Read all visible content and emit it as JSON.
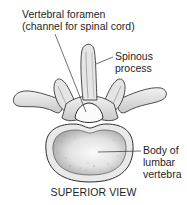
{
  "diagram": {
    "title": "SUPERIOR VIEW",
    "subject": "Lumbar vertebra",
    "labels": [
      {
        "id": "foramen",
        "lines": [
          "Vertebral foramen",
          "(channel for spinal cord)"
        ]
      },
      {
        "id": "spinous",
        "lines": [
          "Spinous",
          "process"
        ]
      },
      {
        "id": "body",
        "lines": [
          "Body of",
          "lumbar",
          "vertebra"
        ]
      }
    ]
  },
  "colors": {
    "bone_fill": "#eeeeee",
    "bone_outline": "#3a3a3a",
    "body_center": "#f4f4f4",
    "shading": "#9a9a9a",
    "leader_line": "#333333"
  }
}
